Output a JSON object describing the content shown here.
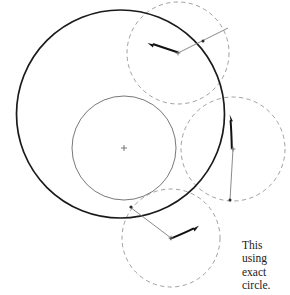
{
  "figure": {
    "background_color": "#ffffff",
    "width": 290,
    "height": 295,
    "stroke_colors": {
      "outer_circle": "#1a1a1a",
      "inner_circle": "#555555",
      "dashed_circle": "#888888",
      "radius_line": "#777777",
      "arrow": "#111111",
      "center_mark": "#666666"
    },
    "circles": [
      {
        "name": "outer-enclosing-circle",
        "style": "solid",
        "cx": 120.5,
        "cy": 114.0,
        "r": 104.0,
        "stroke_width": 1.7,
        "color": "#1a1a1a"
      },
      {
        "name": "inner-center-circle",
        "style": "solid",
        "cx": 124.0,
        "cy": 148.0,
        "r": 52.0,
        "stroke_width": 0.8,
        "color": "#555555"
      },
      {
        "name": "top-right-dashed-circle",
        "style": "dashed",
        "cx": 178.0,
        "cy": 53.0,
        "r": 51.0,
        "stroke_width": 0.8,
        "color": "#888888"
      },
      {
        "name": "right-dashed-circle",
        "style": "dashed",
        "cx": 233.0,
        "cy": 149.0,
        "r": 52.0,
        "stroke_width": 0.8,
        "color": "#888888"
      },
      {
        "name": "bottom-dashed-circle",
        "style": "dashed",
        "cx": 171.0,
        "cy": 238.0,
        "r": 49.0,
        "stroke_width": 0.8,
        "color": "#888888"
      }
    ],
    "center_marks": [
      {
        "name": "inner-circle-center-mark",
        "x": 124.0,
        "y": 148.0,
        "size": 3.0
      },
      {
        "name": "top-right-circle-center-mark",
        "x": 178.0,
        "y": 53.0,
        "size": 2.4
      },
      {
        "name": "right-circle-center-mark",
        "x": 233.0,
        "y": 149.0,
        "size": 2.4
      },
      {
        "name": "bottom-circle-center-mark",
        "x": 171.0,
        "y": 238.0,
        "size": 2.4
      }
    ],
    "radius_lines": [
      {
        "name": "top-right-radius-line",
        "x1": 178.0,
        "y1": 53.0,
        "x2": 228.0,
        "y2": 28.0
      },
      {
        "name": "right-radius-line",
        "x1": 233.0,
        "y1": 149.0,
        "x2": 230.0,
        "y2": 200.0
      },
      {
        "name": "bottom-radius-line",
        "x1": 171.0,
        "y1": 238.0,
        "x2": 130.0,
        "y2": 207.0
      }
    ],
    "arrows": [
      {
        "name": "top-right-arrow",
        "x1": 177.0,
        "y1": 52.0,
        "x2": 152.0,
        "y2": 44.0
      },
      {
        "name": "right-arrow",
        "x1": 232.0,
        "y1": 148.0,
        "x2": 230.0,
        "y2": 120.0
      },
      {
        "name": "bottom-arrow",
        "x1": 170.0,
        "y1": 239.0,
        "x2": 194.0,
        "y2": 228.0
      }
    ],
    "tangent_marks": [
      {
        "name": "tangent-dot-top-right",
        "x": 203.0,
        "y": 41.0
      },
      {
        "name": "tangent-dot-bottom-left",
        "x": 131.0,
        "y": 207.0
      },
      {
        "name": "tangent-dot-right-lower",
        "x": 230.0,
        "y": 200.0
      }
    ]
  },
  "caption": {
    "name": "figure-caption",
    "lines": [
      "This",
      "using",
      "exact",
      "circle."
    ],
    "line_1": "This",
    "line_2": "using",
    "line_3": "exact",
    "line_4": "circle."
  }
}
